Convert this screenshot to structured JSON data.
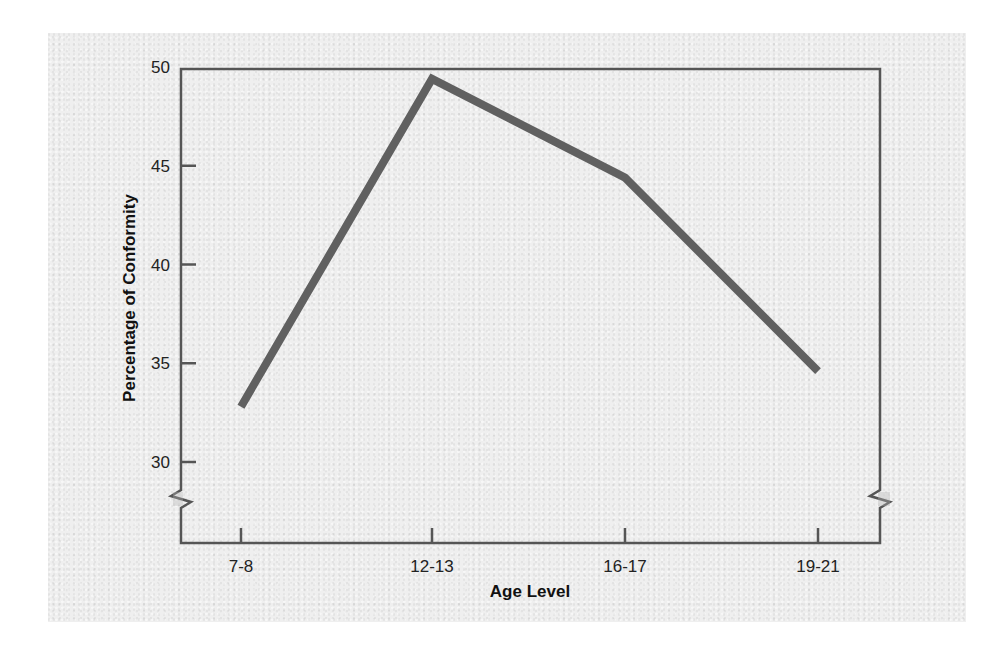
{
  "chart_data": {
    "type": "line",
    "title": "",
    "xlabel": "Age Level",
    "ylabel": "Percentage of Conformity",
    "categories": [
      "7-8",
      "12-13",
      "16-17",
      "19-21"
    ],
    "series": [
      {
        "name": "Conformity",
        "values": [
          32.8,
          49.4,
          44.4,
          34.6
        ],
        "color": "#606060"
      }
    ],
    "yticks": [
      30,
      35,
      40,
      45,
      50
    ],
    "ylim": [
      27.5,
      50
    ],
    "grid": false,
    "legend": null,
    "annotations": [
      "axis break marks on y-axis below 30"
    ]
  },
  "colors": {
    "line": "#606060",
    "axis": "#555555",
    "background": "#efefef"
  }
}
